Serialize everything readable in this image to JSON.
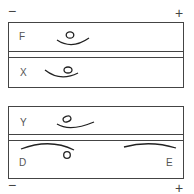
{
  "diagram": {
    "top_panel": {
      "left_sign": "−",
      "right_sign": "+",
      "rows": [
        {
          "label": "F",
          "shape": "smile-curve-with-circle-above"
        },
        {
          "label": "X",
          "shape": "smile-curve-with-circle-above"
        }
      ]
    },
    "bottom_panel": {
      "left_sign": "−",
      "right_sign": "+",
      "rows": [
        {
          "label": "Y",
          "shape": "curve-with-circle-above"
        },
        {
          "label_left": "D",
          "label_right": "E",
          "shape": "frown-curves"
        }
      ]
    },
    "colors": {
      "stroke": "#444444",
      "text": "#555555",
      "background": "#ffffff"
    }
  }
}
